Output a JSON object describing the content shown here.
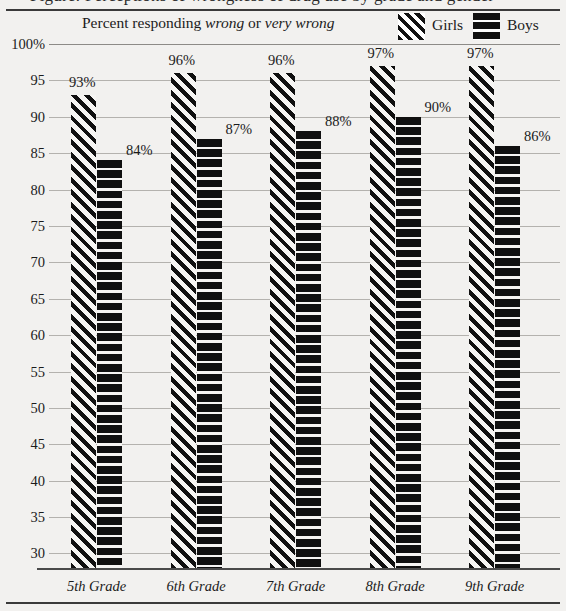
{
  "title_fragment": "Figure: Perceptions of wrongness of drug use by grade and gender",
  "subtitle": {
    "prefix": "Percent responding ",
    "italic_one": "wrong",
    "middle": " or ",
    "italic_two": "very wrong"
  },
  "legend": {
    "position": "top-right",
    "entries": [
      {
        "label": "Girls",
        "swatch": "diagonal-hatch-swatch",
        "color": "#101010"
      },
      {
        "label": "Boys",
        "swatch": "horizontal-stripe-swatch",
        "color": "#101010"
      }
    ]
  },
  "chart_data": {
    "type": "bar",
    "title": "Percent responding wrong or very wrong",
    "xlabel": "",
    "ylabel": "",
    "categories": [
      "5th Grade",
      "6th Grade",
      "7th Grade",
      "8th Grade",
      "9th Grade"
    ],
    "series": [
      {
        "name": "Girls",
        "values": [
          93,
          96,
          96,
          97,
          97
        ],
        "pattern": "diagonal-hatch"
      },
      {
        "name": "Boys",
        "values": [
          84,
          87,
          88,
          90,
          86
        ],
        "pattern": "horizontal-stripes"
      }
    ],
    "value_labels": [
      [
        "93%",
        "96%",
        "96%",
        "97%",
        "97%"
      ],
      [
        "84%",
        "87%",
        "88%",
        "90%",
        "86%"
      ]
    ],
    "ylim": [
      28,
      100
    ],
    "yticks": [
      100,
      95,
      90,
      85,
      80,
      75,
      70,
      65,
      60,
      55,
      50,
      45,
      40,
      35,
      30
    ],
    "ytick_labels": [
      "100%",
      "95",
      "90",
      "85",
      "80",
      "75",
      "70",
      "65",
      "60",
      "55",
      "50",
      "45",
      "40",
      "35",
      "30"
    ],
    "grid": true,
    "legend": "top-right"
  }
}
